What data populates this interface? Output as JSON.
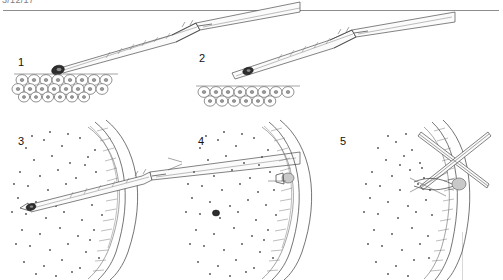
{
  "header": {
    "clipped_text": "3/12/17",
    "rule": "horizontal-divider"
  },
  "figure": {
    "title_visible": false,
    "kind": "line-drawing scientific illustration",
    "panel_count": 5,
    "panels": [
      {
        "number": "1",
        "label_x": 18,
        "label_y": 57,
        "description": "Micropipette lowered at an angle onto an epithelial cell sheet; a single dark donor cell sits at the pipette tip."
      },
      {
        "number": "2",
        "label_x": 199,
        "label_y": 53,
        "description": "Micropipette raised above the cell sheet with the dark donor cell now drawn up inside the pipette lumen."
      },
      {
        "number": "3",
        "label_x": 18,
        "label_y": 136,
        "description": "Pipette pierces the curved hatched tissue wall; its tip with the dark cell lies inside the stippled host region."
      },
      {
        "number": "4",
        "label_x": 198,
        "label_y": 136,
        "description": "Pipette withdrawn; the dark transplanted cell rests inside the stippled host region and a small plug marks the wall puncture."
      },
      {
        "number": "5",
        "label_x": 340,
        "label_y": 136,
        "description": "Crossed needles close the puncture site over the small plug on the tissue wall."
      }
    ]
  },
  "colors": {
    "background": "#ffffff",
    "ink": "#3a3a3a",
    "stipple": "#4a4a4a",
    "dark_cell": "#2e2e2e",
    "plug": "#c9c9c9",
    "rule": "#8d8d8d",
    "header_text": "#7d7d7d"
  }
}
